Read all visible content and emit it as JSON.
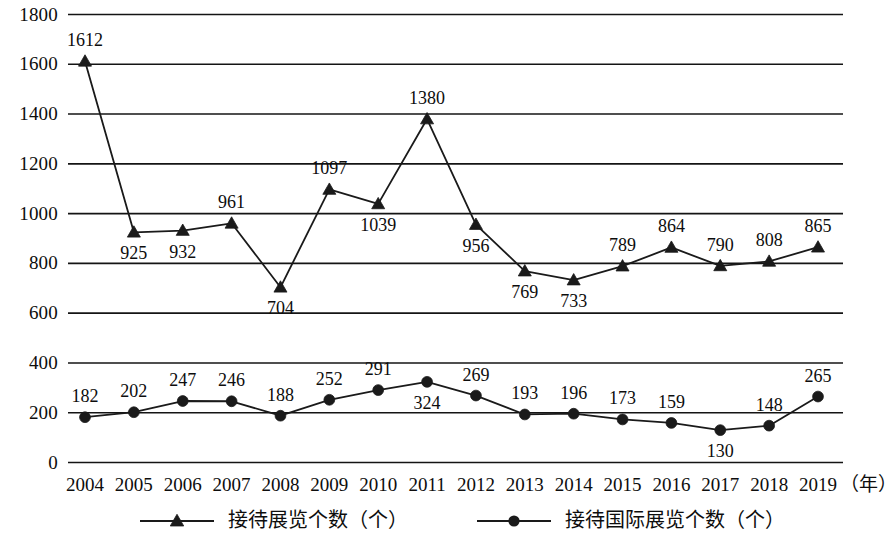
{
  "chart_data": {
    "type": "line",
    "title": "",
    "xlabel": "(年)",
    "ylabel": "",
    "grid": true,
    "legend_position": "bottom",
    "ylim": [
      0,
      1800
    ],
    "yticks": [
      0,
      200,
      400,
      600,
      800,
      1000,
      1200,
      1400,
      1600,
      1800
    ],
    "ytick_labels": [
      "0",
      "200",
      "400",
      "600",
      "800",
      "1000",
      "1200",
      "1400",
      "1600",
      "1800"
    ],
    "categories": [
      "2004",
      "2005",
      "2006",
      "2007",
      "2008",
      "2009",
      "2010",
      "2011",
      "2012",
      "2013",
      "2014",
      "2015",
      "2016",
      "2017",
      "2018",
      "2019"
    ],
    "series": [
      {
        "name": "接待展览个数（个）",
        "marker": "triangle",
        "color": "#1a1a1a",
        "values": [
          1612,
          925,
          932,
          961,
          704,
          1097,
          1039,
          1380,
          956,
          769,
          733,
          789,
          864,
          790,
          808,
          865
        ],
        "label_positions": [
          "above",
          "below",
          "below",
          "above",
          "below",
          "above",
          "below",
          "above",
          "below",
          "below",
          "below",
          "above",
          "above",
          "above",
          "above",
          "above"
        ]
      },
      {
        "name": "接待国际展览个数（个）",
        "marker": "circle",
        "color": "#1a1a1a",
        "values": [
          182,
          202,
          247,
          246,
          188,
          252,
          291,
          324,
          269,
          193,
          196,
          173,
          159,
          130,
          148,
          265
        ],
        "label_positions": [
          "above",
          "above",
          "above",
          "above",
          "above",
          "above",
          "above",
          "below",
          "above",
          "above",
          "above",
          "above",
          "above",
          "below",
          "above",
          "above"
        ]
      }
    ]
  },
  "legend": {
    "entries": [
      {
        "label": "接待展览个数（个）",
        "marker": "triangle"
      },
      {
        "label": "接待国际展览个数（个）",
        "marker": "circle"
      }
    ]
  },
  "x_axis": {
    "unit_label": "（年）"
  }
}
